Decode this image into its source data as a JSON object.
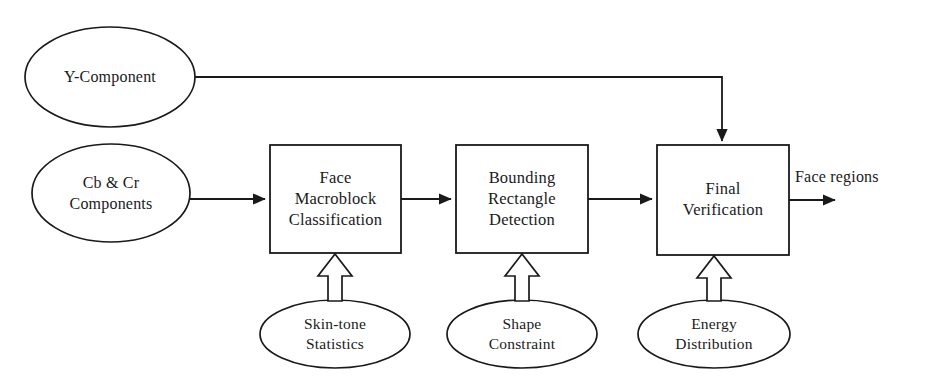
{
  "diagram": {
    "colors": {
      "stroke": "#1a1a1a",
      "fill": "#ffffff",
      "background": "#ffffff"
    },
    "inputs": [
      {
        "id": "y-component",
        "label": "Y-Component",
        "shape": "ellipse"
      },
      {
        "id": "cbcr-components",
        "label": "Cb & Cr\nComponents",
        "shape": "ellipse"
      }
    ],
    "stages": [
      {
        "id": "face-macroblock-classification",
        "label": "Face\nMacroblock\nClassification",
        "shape": "rectangle"
      },
      {
        "id": "bounding-rectangle-detection",
        "label": "Bounding\nRectangle\nDetection",
        "shape": "rectangle"
      },
      {
        "id": "final-verification",
        "label": "Final\nVerification",
        "shape": "rectangle"
      }
    ],
    "knowledge_sources": [
      {
        "id": "skin-tone-statistics",
        "label": "Skin-tone\nStatistics",
        "shape": "ellipse",
        "feeds": "face-macroblock-classification"
      },
      {
        "id": "shape-constraint",
        "label": "Shape\nConstraint",
        "shape": "ellipse",
        "feeds": "bounding-rectangle-detection"
      },
      {
        "id": "energy-distribution",
        "label": "Energy\nDistribution",
        "shape": "ellipse",
        "feeds": "final-verification"
      }
    ],
    "outputs": [
      {
        "id": "face-regions",
        "label": "Face regions"
      }
    ]
  }
}
